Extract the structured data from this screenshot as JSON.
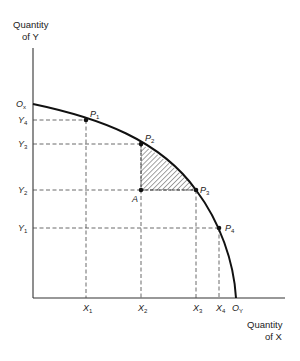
{
  "diagram": {
    "type": "production-possibility-frontier",
    "y_axis_title": [
      "Quantity",
      "of Y"
    ],
    "x_axis_title": [
      "Quantity",
      "of X"
    ],
    "origins": {
      "ox": {
        "letter": "O",
        "sub": "x"
      },
      "oy": {
        "letter": "O",
        "sub": "Y"
      }
    },
    "points": [
      {
        "letter": "P",
        "sub": "1"
      },
      {
        "letter": "P",
        "sub": "2"
      },
      {
        "letter": "P",
        "sub": "3"
      },
      {
        "letter": "P",
        "sub": "4"
      }
    ],
    "point_a": "A",
    "y_ticks": [
      {
        "letter": "Y",
        "sub": "4"
      },
      {
        "letter": "Y",
        "sub": "3"
      },
      {
        "letter": "Y",
        "sub": "2"
      },
      {
        "letter": "Y",
        "sub": "1"
      }
    ],
    "x_ticks": [
      {
        "letter": "X",
        "sub": "1"
      },
      {
        "letter": "X",
        "sub": "2"
      },
      {
        "letter": "X",
        "sub": "3"
      },
      {
        "letter": "X",
        "sub": "4"
      }
    ],
    "colors": {
      "curve": "#111111",
      "axis": "#333333",
      "dashed": "#444444",
      "hatch": "#333333"
    }
  }
}
